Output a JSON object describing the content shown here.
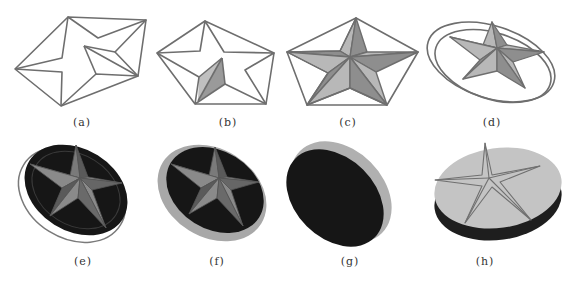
{
  "figure": {
    "panels": [
      {
        "id": "a",
        "caption": "(a)",
        "description": "star wireframe inside irregular pentagon outline"
      },
      {
        "id": "b",
        "caption": "(b)",
        "description": "pentagon with star wireframe, one facet pair shaded"
      },
      {
        "id": "c",
        "caption": "(c)",
        "description": "pentagon with fully faceted shaded star"
      },
      {
        "id": "d",
        "caption": "(d)",
        "description": "faceted star within double ellipse ring"
      },
      {
        "id": "e",
        "caption": "(e)",
        "description": "dark disc with raised star and thin outer ring"
      },
      {
        "id": "f",
        "caption": "(f)",
        "description": "dark disc with raised star and thick grey rim"
      },
      {
        "id": "g",
        "caption": "(g)",
        "description": "back side of disc, dark with grey rim"
      },
      {
        "id": "h",
        "caption": "(h)",
        "description": "light grey coin with engraved star outline, dark side edge"
      }
    ],
    "colors": {
      "line": "#6e6e6e",
      "facet_light": "#b8b8b8",
      "facet_dark": "#8e8e8e",
      "disc_dark": "#161616",
      "rim": "#a8a8a8",
      "coin_face": "#c4c4c4"
    }
  }
}
